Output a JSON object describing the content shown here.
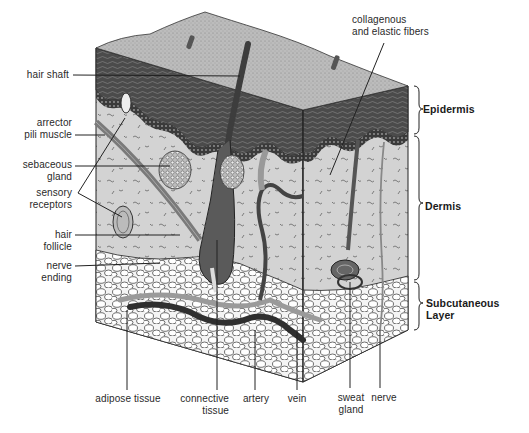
{
  "diagram": {
    "type": "anatomical cross-section",
    "layers": [
      {
        "id": "epidermis",
        "label": "Epidermis"
      },
      {
        "id": "dermis",
        "label": "Dermis"
      },
      {
        "id": "subcutaneous",
        "label_line1": "Subcutaneous",
        "label_line2": "Layer"
      }
    ],
    "left_labels": [
      {
        "id": "hair-shaft",
        "line1": "hair shaft",
        "line2": ""
      },
      {
        "id": "arrector-pili-muscle",
        "line1": "arrector",
        "line2": "pili muscle"
      },
      {
        "id": "sebaceous-gland",
        "line1": "sebaceous",
        "line2": "gland"
      },
      {
        "id": "sensory-receptors",
        "line1": "sensory",
        "line2": "receptors"
      },
      {
        "id": "hair-follicle",
        "line1": "hair",
        "line2": "follicle"
      },
      {
        "id": "nerve-ending",
        "line1": "nerve",
        "line2": "ending"
      }
    ],
    "top_labels": [
      {
        "id": "collagenous-fibers",
        "line1": "collagenous",
        "line2": "and elastic fibers"
      }
    ],
    "bottom_labels": [
      {
        "id": "adipose-tissue",
        "line1": "adipose tissue",
        "line2": ""
      },
      {
        "id": "connective-tissue",
        "line1": "connective",
        "line2": "tissue"
      },
      {
        "id": "artery",
        "line1": "artery",
        "line2": ""
      },
      {
        "id": "vein",
        "line1": "vein",
        "line2": ""
      },
      {
        "id": "sweat-gland",
        "line1": "sweat",
        "line2": "gland"
      },
      {
        "id": "nerve",
        "line1": "nerve",
        "line2": ""
      }
    ],
    "colors": {
      "surface": "#bdbdbd",
      "epidermis_dark": "#4a4a4a",
      "dermis": "#d2d2d2",
      "fat": "#ffffff",
      "leader_line": "#222222"
    }
  }
}
